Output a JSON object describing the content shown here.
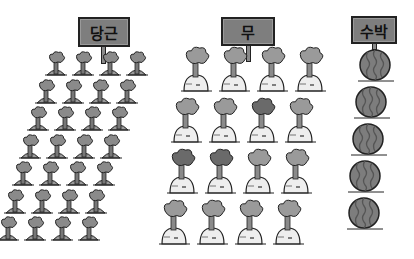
{
  "illustration": {
    "groups": [
      {
        "label": "당근",
        "meaning": "carrot",
        "rows": 7,
        "cols": 4,
        "count": 28
      },
      {
        "label": "무",
        "meaning": "radish",
        "rows": 4,
        "cols": 4,
        "count": 16
      },
      {
        "label": "수박",
        "meaning": "watermelon",
        "rows": 5,
        "cols": 1,
        "count": 5
      }
    ]
  }
}
